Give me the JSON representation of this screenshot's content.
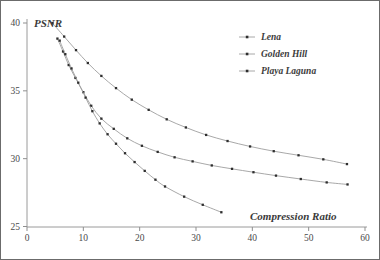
{
  "chart_data": {
    "type": "line",
    "title": "",
    "subtitle": "",
    "xlabel": "Compression Ratio",
    "ylabel": "PSNR",
    "xlim": [
      0,
      60
    ],
    "ylim": [
      25,
      40
    ],
    "xticks": [
      0,
      10,
      20,
      30,
      40,
      50,
      60
    ],
    "yticks": [
      25,
      30,
      35,
      40
    ],
    "xtick_labels": [
      "0",
      "10",
      "20",
      "30",
      "40",
      "50",
      "60"
    ],
    "ytick_labels": [
      "25",
      "30",
      "35",
      "40"
    ],
    "grid": false,
    "legend_position": "top-right",
    "marker": "square",
    "line_color": "#9e9e9e",
    "marker_color": "#2e2e2e",
    "series": [
      {
        "name": "Lena",
        "x": [
          4.5,
          6.6,
          8.7,
          10.8,
          13.2,
          15.8,
          18.6,
          21.6,
          24.8,
          28.2,
          31.8,
          35.6,
          39.6,
          43.8,
          48.2,
          52.6,
          56.8
        ],
        "y": [
          40.0,
          39.0,
          38.0,
          37.05,
          36.1,
          35.2,
          34.35,
          33.6,
          32.9,
          32.3,
          31.75,
          31.3,
          30.9,
          30.55,
          30.25,
          29.95,
          29.6
        ]
      },
      {
        "name": "Golden Hill",
        "x": [
          5.4,
          6.4,
          7.4,
          8.6,
          10.0,
          11.4,
          13.2,
          15.4,
          17.8,
          20.4,
          23.2,
          26.2,
          29.4,
          32.8,
          36.4,
          40.2,
          44.2,
          48.6,
          53.2,
          56.9
        ],
        "y": [
          38.85,
          37.9,
          36.9,
          35.95,
          34.9,
          33.9,
          32.95,
          32.2,
          31.5,
          30.95,
          30.5,
          30.1,
          29.8,
          29.5,
          29.25,
          29.0,
          28.75,
          28.5,
          28.25,
          28.1
        ]
      },
      {
        "name": "Playa Laguna",
        "x": [
          5.8,
          6.8,
          7.9,
          9.1,
          10.4,
          11.6,
          12.9,
          14.3,
          15.8,
          17.4,
          19.1,
          20.9,
          22.8,
          24.5,
          27.9,
          31.2,
          34.5
        ],
        "y": [
          38.7,
          37.7,
          36.65,
          35.6,
          34.5,
          33.5,
          32.6,
          31.8,
          31.1,
          30.4,
          29.75,
          29.1,
          28.45,
          27.95,
          27.2,
          26.6,
          26.05
        ]
      }
    ]
  },
  "legend": {
    "entries": [
      {
        "label": "Lena"
      },
      {
        "label": "Golden Hill"
      },
      {
        "label": "Playa Laguna"
      }
    ]
  },
  "axes": {
    "x_title": "Compression Ratio",
    "y_title": "PSNR"
  }
}
